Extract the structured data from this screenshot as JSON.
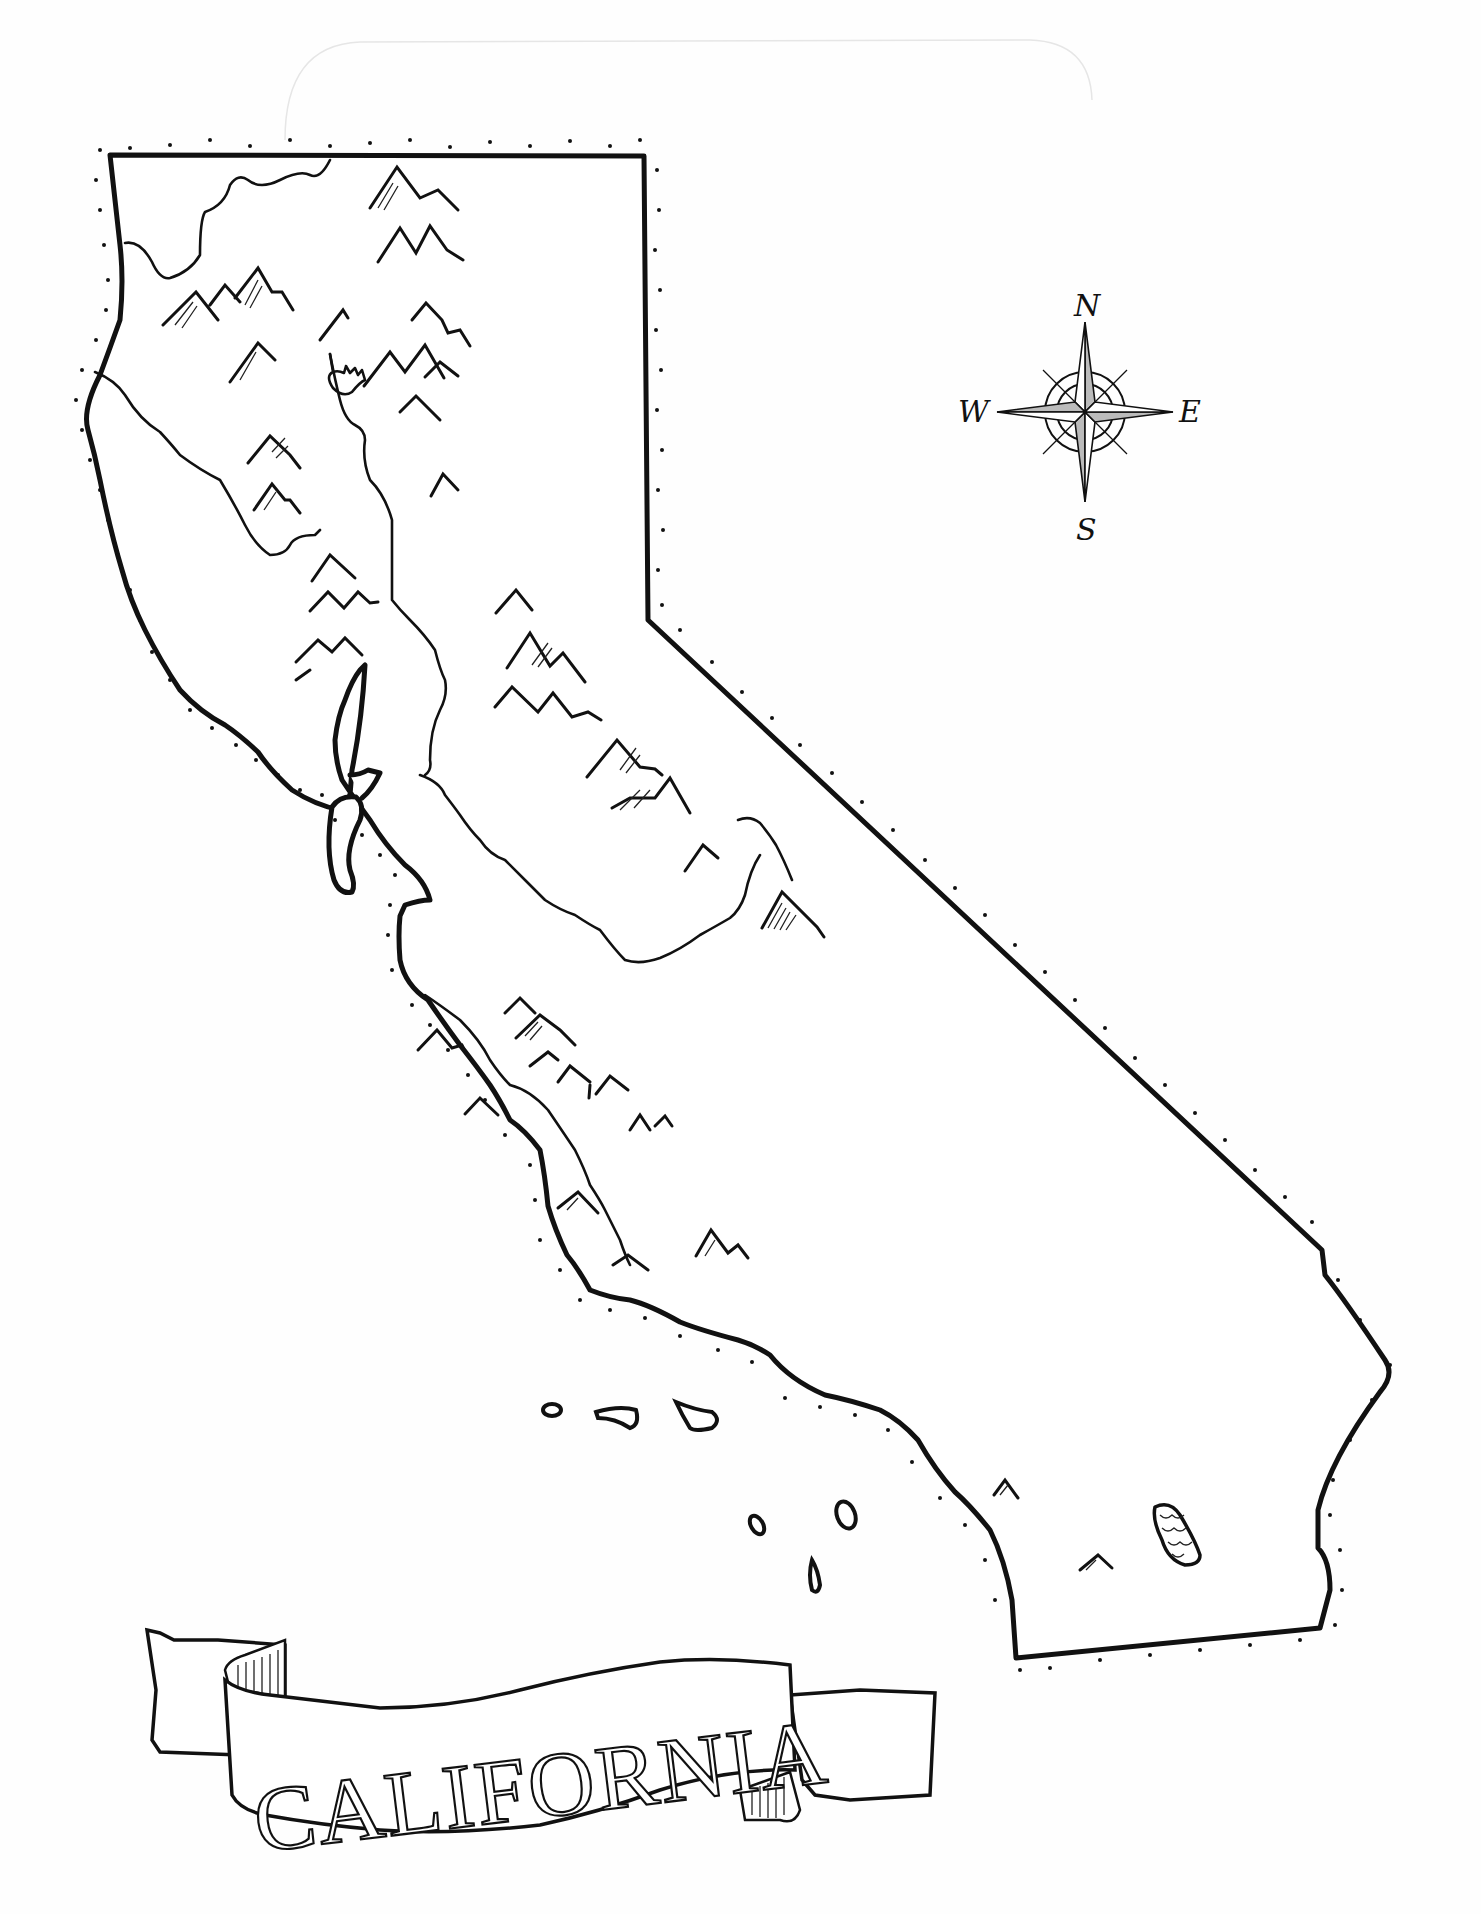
{
  "map": {
    "title": "CALIFORNIA",
    "subject": "State of California outline map",
    "style": "hand-drawn ink illustration",
    "features": {
      "mountain_ranges": [
        "Klamath Mountains",
        "Cascade Range",
        "Coast Ranges",
        "Sierra Nevada",
        "Transverse Ranges"
      ],
      "lakes": [
        "Shasta Lake",
        "Salton Sea"
      ],
      "rivers": [
        "Sacramento River",
        "San Joaquin River"
      ],
      "islands": [
        "Channel Islands (northern)",
        "Channel Islands (southern)"
      ],
      "bays": [
        "San Francisco Bay"
      ]
    }
  },
  "compass": {
    "north": "N",
    "east": "E",
    "south": "S",
    "west": "W"
  },
  "banner": {
    "label": "CALIFORNIA"
  },
  "colors": {
    "ink": "#111111",
    "paper": "#fefefe"
  }
}
